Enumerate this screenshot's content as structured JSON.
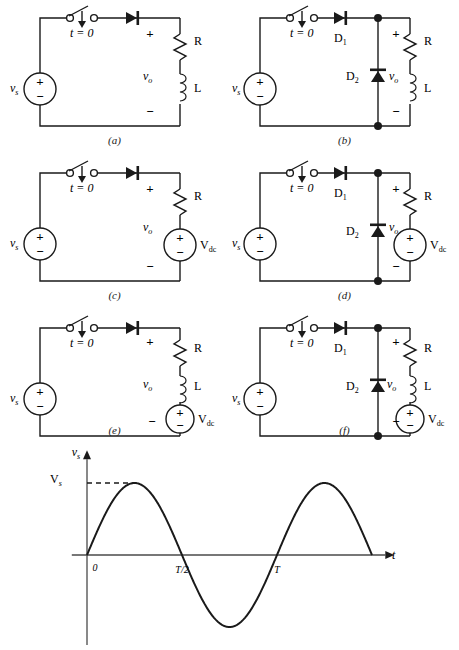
{
  "figure": {
    "type": "circuit-schematic-set",
    "panel_count": 6,
    "panels": [
      {
        "id": "a",
        "caption": "(a)",
        "source_label": "v",
        "source_sub": "s",
        "switch_label": "t = 0",
        "plus": "+",
        "minus": "−",
        "vo_label": "v",
        "vo_sub": "o",
        "components": [
          "R",
          "L"
        ],
        "has_freewheel_diode": false,
        "has_dc_source": false
      },
      {
        "id": "b",
        "caption": "(b)",
        "source_label": "v",
        "source_sub": "s",
        "switch_label": "t = 0",
        "plus": "+",
        "minus": "−",
        "vo_label": "v",
        "vo_sub": "o",
        "components": [
          "R",
          "L"
        ],
        "diode1": "D",
        "diode1_sub": "1",
        "diode2": "D",
        "diode2_sub": "2",
        "has_freewheel_diode": true,
        "has_dc_source": false
      },
      {
        "id": "c",
        "caption": "(c)",
        "source_label": "v",
        "source_sub": "s",
        "switch_label": "t = 0",
        "plus": "+",
        "minus": "−",
        "vo_label": "v",
        "vo_sub": "o",
        "components": [
          "R"
        ],
        "dc_label": "V",
        "dc_sub": "dc",
        "has_freewheel_diode": false,
        "has_dc_source": true
      },
      {
        "id": "d",
        "caption": "(d)",
        "source_label": "v",
        "source_sub": "s",
        "switch_label": "t = 0",
        "plus": "+",
        "minus": "−",
        "vo_label": "v",
        "vo_sub": "o",
        "components": [
          "R"
        ],
        "diode1": "D",
        "diode1_sub": "1",
        "diode2": "D",
        "diode2_sub": "2",
        "dc_label": "V",
        "dc_sub": "dc",
        "has_freewheel_diode": true,
        "has_dc_source": true
      },
      {
        "id": "e",
        "caption": "(e)",
        "source_label": "v",
        "source_sub": "s",
        "switch_label": "t = 0",
        "plus": "+",
        "minus": "−",
        "vo_label": "v",
        "vo_sub": "o",
        "components": [
          "R",
          "L"
        ],
        "dc_label": "V",
        "dc_sub": "dc",
        "has_freewheel_diode": false,
        "has_dc_source": true
      },
      {
        "id": "f",
        "caption": "(f)",
        "source_label": "v",
        "source_sub": "s",
        "switch_label": "t = 0",
        "plus": "+",
        "minus": "−",
        "vo_label": "v",
        "vo_sub": "o",
        "components": [
          "R",
          "L"
        ],
        "diode1": "D",
        "diode1_sub": "1",
        "diode2": "D",
        "diode2_sub": "2",
        "dc_label": "V",
        "dc_sub": "dc",
        "has_freewheel_diode": true,
        "has_dc_source": true
      }
    ]
  },
  "chart_data": {
    "type": "line",
    "title": "",
    "xlabel": "t",
    "ylabel": "v",
    "ylabel_sub": "s",
    "ylabel_full": "v_s",
    "peak_label": "V",
    "peak_label_sub": "s",
    "x_tick_labels": [
      "0",
      "T/2",
      "T"
    ],
    "x_tick_values": [
      0,
      0.5,
      1.0
    ],
    "xlim": [
      -0.08,
      1.62
    ],
    "ylim": [
      -1.25,
      1.25
    ],
    "grid": false,
    "legend": false,
    "series": [
      {
        "name": "v_s",
        "expression": "V_s * sin(2*pi*t/T)",
        "x": [
          0,
          0.05,
          0.1,
          0.15,
          0.2,
          0.25,
          0.3,
          0.35,
          0.4,
          0.45,
          0.5,
          0.55,
          0.6,
          0.65,
          0.7,
          0.75,
          0.8,
          0.85,
          0.9,
          0.95,
          1.0,
          1.05,
          1.1,
          1.15,
          1.2,
          1.25,
          1.3,
          1.35,
          1.4,
          1.45,
          1.5
        ],
        "values": [
          0,
          0.309,
          0.588,
          0.809,
          0.951,
          1.0,
          0.951,
          0.809,
          0.588,
          0.309,
          0,
          -0.309,
          -0.588,
          -0.809,
          -0.951,
          -1.0,
          -0.951,
          -0.809,
          -0.588,
          -0.309,
          0,
          0.309,
          0.588,
          0.809,
          0.951,
          1.0,
          0.951,
          0.809,
          0.588,
          0.309,
          0
        ]
      }
    ],
    "annotations": [
      {
        "name": "peak-dashed-line",
        "from": [
          0,
          1.0
        ],
        "to": [
          0.25,
          1.0
        ],
        "style": "dashed"
      }
    ],
    "colors": {
      "curve": "#1a1a1a",
      "axis": "#4a4a4a",
      "background": "#ffffff"
    }
  },
  "colors": {
    "wire": "#1a1a1a",
    "fill_solid": "#1a1a1a",
    "fill_hollow": "#ffffff",
    "background": "#ffffff",
    "axis": "#4a4a4a"
  }
}
